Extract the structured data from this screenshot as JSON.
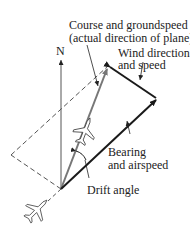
{
  "diagram": {
    "labels": {
      "north": "N",
      "course_line1": "Course and groundspeed",
      "course_line2": "(actual direction of plane)",
      "wind_line1": "Wind direction",
      "wind_line2": "and speed",
      "bearing_line1": "Bearing",
      "bearing_line2": "and airspeed",
      "drift": "Drift angle"
    },
    "points": {
      "origin": [
        61,
        189
      ],
      "groundspeed_tip": [
        108,
        66
      ],
      "airspeed_tip": [
        158,
        99
      ],
      "dashed_vertex": [
        11,
        155
      ],
      "north_tip": [
        61,
        58
      ]
    },
    "colors": {
      "bold_vector": "#1a1a1a",
      "gray_vector": "#777777",
      "dashed": "#555555",
      "text": "#222222"
    }
  }
}
